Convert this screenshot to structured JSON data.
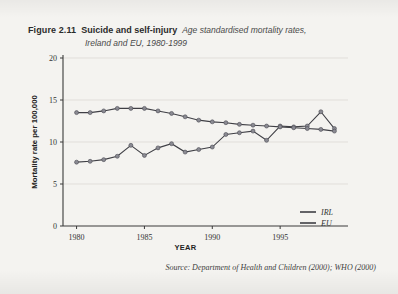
{
  "figure": {
    "number": "Figure 2.11",
    "name": "Suicide and self-injury",
    "subtitle_line1": "Age standardised mortality rates,",
    "subtitle_line2": "Ireland and EU, 1980-1999"
  },
  "source": {
    "text": "Source: Department of Health and Children (2000); WHO (2000)"
  },
  "colors": {
    "page_background": "#f4f3f0",
    "axis": "#3a3a3a",
    "grid": "#d8d6d1",
    "line": "#3f3f45",
    "marker_fill": "#8a8a92",
    "text": "#2b2b2b"
  },
  "chart_data": {
    "type": "line",
    "title": "Suicide and self-injury",
    "subtitle": "Age standardised mortality rates, Ireland and EU, 1980-1999",
    "xlabel": "YEAR",
    "ylabel": "Mortality rate per 100,000",
    "xlim": [
      1979,
      2000
    ],
    "ylim": [
      0,
      20
    ],
    "ytick_labels": [
      "0",
      "5",
      "10",
      "15",
      "20"
    ],
    "yticks": [
      0,
      5,
      10,
      15,
      20
    ],
    "xtick_labels": [
      "1980",
      "1985",
      "1990",
      "1995"
    ],
    "xticks": [
      1980,
      1985,
      1990,
      1995
    ],
    "grid": true,
    "legend_position": "bottom-right",
    "x": [
      1980,
      1981,
      1982,
      1983,
      1984,
      1985,
      1986,
      1987,
      1988,
      1989,
      1990,
      1991,
      1992,
      1993,
      1994,
      1995,
      1996,
      1997,
      1998,
      1999
    ],
    "series": [
      {
        "name": "IRL",
        "values": [
          7.6,
          7.7,
          7.9,
          8.3,
          9.6,
          8.4,
          9.3,
          9.8,
          8.8,
          9.1,
          9.4,
          10.9,
          11.1,
          11.3,
          10.2,
          11.9,
          11.8,
          11.9,
          13.6,
          11.6
        ]
      },
      {
        "name": "EU",
        "values": [
          13.5,
          13.5,
          13.7,
          14.0,
          14.0,
          14.0,
          13.7,
          13.4,
          13.0,
          12.6,
          12.4,
          12.3,
          12.1,
          12.0,
          11.9,
          11.8,
          11.7,
          11.6,
          11.5,
          11.3
        ]
      }
    ]
  }
}
